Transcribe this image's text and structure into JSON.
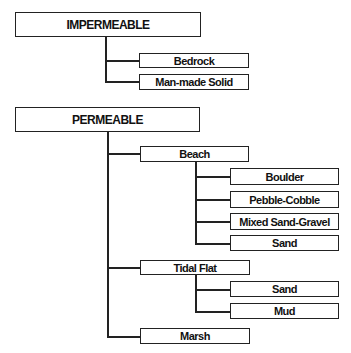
{
  "diagram": {
    "impermeable": {
      "label": "IMPERMEABLE",
      "children": [
        {
          "label": "Bedrock"
        },
        {
          "label": "Man-made Solid"
        }
      ]
    },
    "permeable": {
      "label": "PERMEABLE",
      "children": [
        {
          "label": "Beach",
          "children": [
            {
              "label": "Boulder"
            },
            {
              "label": "Pebble-Cobble"
            },
            {
              "label": "Mixed Sand-Gravel"
            },
            {
              "label": "Sand"
            }
          ]
        },
        {
          "label": "Tidal Flat",
          "children": [
            {
              "label": "Sand"
            },
            {
              "label": "Mud"
            }
          ]
        },
        {
          "label": "Marsh"
        }
      ]
    }
  }
}
